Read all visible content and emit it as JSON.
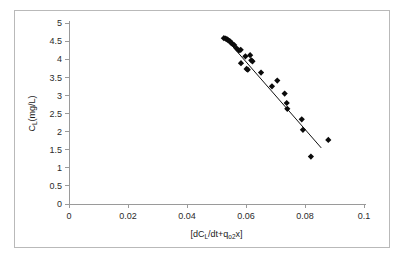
{
  "chart_data": {
    "type": "scatter",
    "title": "",
    "xlabel_parts": {
      "pre": "[dC",
      "sub1": "L",
      "mid": "/dt+q",
      "sub2": "o2",
      "post": "x]"
    },
    "xlabel": "[dCL/dt+qo2x]",
    "ylabel_parts": {
      "pre": "C",
      "sub1": "L",
      "post": "(mg/L)"
    },
    "ylabel": "CL(mg/L)",
    "xlim": [
      0,
      0.1
    ],
    "ylim": [
      0,
      5
    ],
    "xticks": [
      0,
      0.02,
      0.04,
      0.06,
      0.08,
      0.1
    ],
    "xtick_labels": [
      "0",
      "0.02",
      "0.04",
      "0.06",
      "0.08",
      "0.1"
    ],
    "yticks": [
      0,
      0.5,
      1,
      1.5,
      2,
      2.5,
      3,
      3.5,
      4,
      4.5,
      5
    ],
    "ytick_labels": [
      "0",
      "0.5",
      "1",
      "1.5",
      "2",
      "2.5",
      "3",
      "3.5",
      "4",
      "4.5",
      "5"
    ],
    "grid": false,
    "legend": false,
    "marker_style": "diamond",
    "marker_color": "#0b0b0b",
    "line_color": "#111111",
    "series": [
      {
        "name": "CL vs oxygen uptake term",
        "points": [
          [
            0.0525,
            4.58
          ],
          [
            0.0531,
            4.57
          ],
          [
            0.0536,
            4.55
          ],
          [
            0.054,
            4.52
          ],
          [
            0.0545,
            4.5
          ],
          [
            0.0549,
            4.46
          ],
          [
            0.0553,
            4.43
          ],
          [
            0.056,
            4.39
          ],
          [
            0.0568,
            4.3
          ],
          [
            0.0576,
            4.24
          ],
          [
            0.0582,
            4.26
          ],
          [
            0.0583,
            3.89
          ],
          [
            0.0598,
            4.08
          ],
          [
            0.0602,
            3.73
          ],
          [
            0.0606,
            3.71
          ],
          [
            0.0614,
            4.11
          ],
          [
            0.0618,
            3.97
          ],
          [
            0.0622,
            3.94
          ],
          [
            0.0651,
            3.63
          ],
          [
            0.0688,
            3.25
          ],
          [
            0.0706,
            3.41
          ],
          [
            0.0731,
            3.05
          ],
          [
            0.0738,
            2.79
          ],
          [
            0.074,
            2.63
          ],
          [
            0.0789,
            2.34
          ],
          [
            0.0793,
            2.05
          ],
          [
            0.082,
            1.31
          ],
          [
            0.0879,
            1.77
          ]
        ]
      }
    ],
    "trendline": {
      "x_start": 0.0528,
      "y_start": 4.6,
      "x_end": 0.0855,
      "y_end": 1.55
    }
  }
}
